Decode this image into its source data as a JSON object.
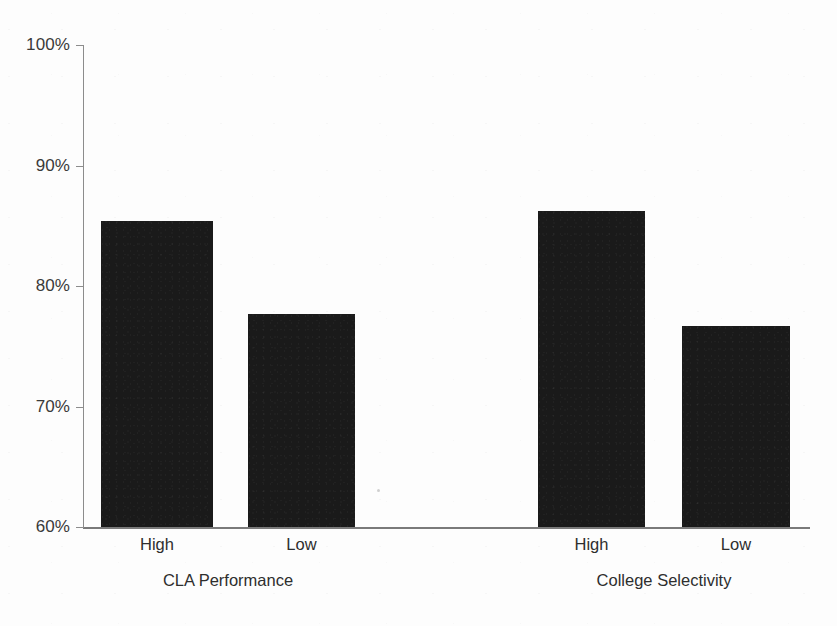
{
  "chart_data": {
    "type": "bar",
    "title": "",
    "subtitle": "",
    "xlabel": "",
    "ylabel": "",
    "ylim": [
      60,
      100
    ],
    "y_tick_labels": [
      "100%",
      "90%",
      "80%",
      "70%",
      "60%"
    ],
    "y_ticks": [
      100,
      90,
      80,
      70,
      60
    ],
    "y_tick_format": "percent",
    "grid": false,
    "legend": false,
    "legend_position": "none",
    "bar_color": "#1a1a1a",
    "axis_color": "#8c8c8c",
    "background_color": "#fdfdfd",
    "groups": [
      {
        "name": "CLA Performance",
        "categories": [
          "High",
          "Low"
        ],
        "values": [
          85.4,
          77.7
        ]
      },
      {
        "name": "College Selectivity",
        "categories": [
          "High",
          "Low"
        ],
        "values": [
          86.2,
          76.7
        ]
      }
    ],
    "categories": [
      "High",
      "Low",
      "High",
      "Low"
    ],
    "values": [
      85.4,
      77.7,
      86.2,
      76.7
    ]
  },
  "axis": {
    "ticks": [
      {
        "label": "100%",
        "value": 100
      },
      {
        "label": "90%",
        "value": 90
      },
      {
        "label": "80%",
        "value": 80
      },
      {
        "label": "70%",
        "value": 70
      },
      {
        "label": "60%",
        "value": 60
      }
    ]
  },
  "bars": [
    {
      "category": "High",
      "group": "CLA Performance",
      "value": 85.4
    },
    {
      "category": "Low",
      "group": "CLA Performance",
      "value": 77.7
    },
    {
      "category": "High",
      "group": "College Selectivity",
      "value": 86.2
    },
    {
      "category": "Low",
      "group": "College Selectivity",
      "value": 76.7
    }
  ],
  "category_labels": [
    {
      "text": "High"
    },
    {
      "text": "Low"
    },
    {
      "text": "High"
    },
    {
      "text": "Low"
    }
  ],
  "group_labels": [
    {
      "text": "CLA Performance"
    },
    {
      "text": "College Selectivity"
    }
  ]
}
